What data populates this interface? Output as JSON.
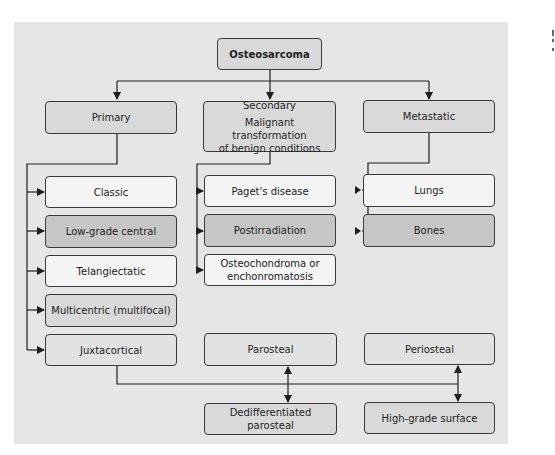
{
  "diagram": {
    "type": "flowchart",
    "title": "Osteosarcoma",
    "colors": {
      "page_bg": "#ffffff",
      "panel_bg": "#e6e6e6",
      "light_fill": "#f4f4f4",
      "medium_fill": "#d9d9d9",
      "dark_fill": "#c6c6c6",
      "line": "#1e1e1e"
    },
    "root": {
      "id": "osteosarcoma",
      "label": "Osteosarcoma"
    },
    "categories": [
      {
        "id": "primary",
        "label": "Primary",
        "children": [
          {
            "id": "classic",
            "label": "Classic"
          },
          {
            "id": "low-grade-central",
            "label": "Low-grade central"
          },
          {
            "id": "telangiectatic",
            "label": "Telangiectatic"
          },
          {
            "id": "multicentric",
            "label": "Multicentric (multifocal)"
          },
          {
            "id": "juxtacortical",
            "label": "Juxtacortical"
          }
        ]
      },
      {
        "id": "secondary",
        "label": "Secondary",
        "sublabel_line1": "Malignant transformation",
        "sublabel_line2": "of benign conditions",
        "children": [
          {
            "id": "pagets-disease",
            "label": "Paget's disease"
          },
          {
            "id": "postirradiation",
            "label": "Postirradiation"
          },
          {
            "id": "osteochondroma",
            "label_line1": "Osteochondroma or",
            "label_line2": "enchonromatosis"
          }
        ]
      },
      {
        "id": "metastatic",
        "label": "Metastatic",
        "children": [
          {
            "id": "lungs",
            "label": "Lungs"
          },
          {
            "id": "bones",
            "label": "Bones"
          }
        ]
      }
    ],
    "juxtacortical_subtypes": [
      {
        "id": "parosteal",
        "label": "Parosteal",
        "linked": {
          "id": "dedifferentiated-parosteal",
          "label": "Dedifferentiated parosteal"
        }
      },
      {
        "id": "periosteal",
        "label": "Periosteal",
        "linked": {
          "id": "high-grade-surface",
          "label": "High-grade surface"
        }
      }
    ],
    "edges": [
      [
        "osteosarcoma",
        "primary"
      ],
      [
        "osteosarcoma",
        "secondary"
      ],
      [
        "osteosarcoma",
        "metastatic"
      ],
      [
        "primary",
        "classic"
      ],
      [
        "primary",
        "low-grade-central"
      ],
      [
        "primary",
        "telangiectatic"
      ],
      [
        "primary",
        "multicentric"
      ],
      [
        "primary",
        "juxtacortical"
      ],
      [
        "secondary",
        "pagets-disease"
      ],
      [
        "secondary",
        "postirradiation"
      ],
      [
        "secondary",
        "osteochondroma"
      ],
      [
        "metastatic",
        "lungs"
      ],
      [
        "metastatic",
        "bones"
      ],
      [
        "juxtacortical",
        "parosteal-dedifferentiated-link"
      ],
      [
        "juxtacortical",
        "periosteal-highgrade-link"
      ],
      [
        "parosteal",
        "dedifferentiated-parosteal",
        "bidirectional"
      ],
      [
        "periosteal",
        "high-grade-surface",
        "bidirectional"
      ]
    ]
  }
}
